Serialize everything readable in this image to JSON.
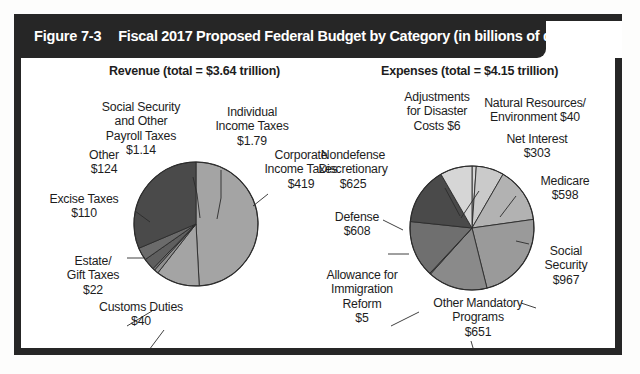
{
  "figure": {
    "number_label": "Figure 7-3",
    "title": "Fiscal 2017 Proposed Federal Budget by Category (in billions of dollars)"
  },
  "colors": {
    "banner_background": "#262626",
    "banner_text": "#ffffff",
    "frame_border": "#262626",
    "panel_background": "#ffffff",
    "slice_dark": "#4a4a4a",
    "slice_mid_dark": "#5f5f5f",
    "slice_mid": "#787878",
    "slice_gray": "#8f8f8f",
    "slice_light_gray": "#a4a4a4",
    "slice_lighter": "#bdbdbd",
    "slice_lightest": "#d6d6d6",
    "slice_outline": "#2b2b2b",
    "leader_line": "#2b2b2b",
    "label_text": "#1d1d1d"
  },
  "chart_data": [
    {
      "type": "pie",
      "title": "Revenue (total = $3.64 trillion)",
      "total_label": "$3.64 trillion",
      "units": "billions of dollars",
      "legend": "none",
      "grid": false,
      "categories": [
        "Individual Income Taxes",
        "Corporate Income Taxes",
        "Customs Duties",
        "Estate/Gift Taxes",
        "Excise Taxes",
        "Other",
        "Social Security and Other Payroll Taxes"
      ],
      "values": [
        1790,
        419,
        40,
        22,
        110,
        124,
        1140
      ],
      "value_labels": [
        "$1.79",
        "$419",
        "$40",
        "$22",
        "$110",
        "$124",
        "$1.14"
      ],
      "slices": [
        {
          "name": "Individual Income Taxes",
          "value": 1790,
          "value_label": "$1.79",
          "label_lines": [
            "Individual",
            "Income Taxes",
            "$1.79"
          ],
          "shade": "#a4a4a4",
          "start_deg": 0,
          "end_deg": 177
        },
        {
          "name": "Corporate Income Taxes",
          "value": 419,
          "value_label": "$419",
          "label_lines": [
            "Corporate",
            "Income Taxes",
            "$419"
          ],
          "shade": "#a4a4a4",
          "start_deg": 177,
          "end_deg": 218
        },
        {
          "name": "Customs Duties",
          "value": 40,
          "value_label": "$40",
          "label_lines": [
            "Customs Duties",
            "$40"
          ],
          "shade": "#8f8f8f",
          "start_deg": 218,
          "end_deg": 222
        },
        {
          "name": "Estate/Gift Taxes",
          "value": 22,
          "value_label": "$22",
          "label_lines": [
            "Estate/",
            "Gift Taxes",
            "$22"
          ],
          "shade": "#787878",
          "start_deg": 222,
          "end_deg": 224
        },
        {
          "name": "Excise Taxes",
          "value": 110,
          "value_label": "$110",
          "label_lines": [
            "Excise Taxes",
            "$110"
          ],
          "shade": "#5f5f5f",
          "start_deg": 224,
          "end_deg": 235
        },
        {
          "name": "Other",
          "value": 124,
          "value_label": "$124",
          "label_lines": [
            "Other",
            "$124"
          ],
          "shade": "#6b6b6b",
          "start_deg": 235,
          "end_deg": 247
        },
        {
          "name": "Social Security and Other Payroll Taxes",
          "value": 1140,
          "value_label": "$1.14",
          "label_lines": [
            "Social Security",
            "and Other",
            "Payroll Taxes",
            "$1.14"
          ],
          "shade": "#4a4a4a",
          "start_deg": 247,
          "end_deg": 360
        }
      ]
    },
    {
      "type": "pie",
      "title": "Expenses (total = $4.15 trillion)",
      "total_label": "$4.15 trillion",
      "units": "billions of dollars",
      "legend": "none",
      "grid": false,
      "categories": [
        "Natural Resources/Environment",
        "Net Interest",
        "Medicare",
        "Social Security",
        "Other Mandatory Programs",
        "Allowance for Immigration Reform",
        "Defense",
        "Nondefense Discretionary",
        "Adjustments for Disaster Costs"
      ],
      "values": [
        40,
        303,
        598,
        967,
        651,
        5,
        608,
        625,
        6
      ],
      "value_labels": [
        "$40",
        "$303",
        "$598",
        "$967",
        "$651",
        "$5",
        "$608",
        "$625",
        "$6"
      ],
      "slices": [
        {
          "name": "Natural Resources/Environment",
          "value": 40,
          "value_label": "$40",
          "label_lines": [
            "Natural Resources/",
            "Environment $40"
          ],
          "shade": "#d6d6d6",
          "start_deg": 0,
          "end_deg": 4
        },
        {
          "name": "Net Interest",
          "value": 303,
          "value_label": "$303",
          "label_lines": [
            "Net Interest",
            "$303"
          ],
          "shade": "#cacaca",
          "start_deg": 4,
          "end_deg": 30
        },
        {
          "name": "Medicare",
          "value": 598,
          "value_label": "$598",
          "label_lines": [
            "Medicare",
            "$598"
          ],
          "shade": "#b2b2b2",
          "start_deg": 30,
          "end_deg": 82
        },
        {
          "name": "Social Security",
          "value": 967,
          "value_label": "$967",
          "label_lines": [
            "Social",
            "Security",
            "$967"
          ],
          "shade": "#9a9a9a",
          "start_deg": 82,
          "end_deg": 166
        },
        {
          "name": "Other Mandatory Programs",
          "value": 651,
          "value_label": "$651",
          "label_lines": [
            "Other Mandatory",
            "Programs",
            "$651"
          ],
          "shade": "#8a8a8a",
          "start_deg": 166,
          "end_deg": 222
        },
        {
          "name": "Allowance for Immigration Reform",
          "value": 5,
          "value_label": "$5",
          "label_lines": [
            "Allowance for",
            "Immigration",
            "Reform",
            "$5"
          ],
          "shade": "#6f6f6f",
          "start_deg": 222,
          "end_deg": 223
        },
        {
          "name": "Defense",
          "value": 608,
          "value_label": "$608",
          "label_lines": [
            "Defense",
            "$608"
          ],
          "shade": "#6f6f6f",
          "start_deg": 223,
          "end_deg": 276
        },
        {
          "name": "Nondefense Discretionary",
          "value": 625,
          "value_label": "$625",
          "label_lines": [
            "Nondefense",
            "Discretionary",
            "$625"
          ],
          "shade": "#4a4a4a",
          "start_deg": 276,
          "end_deg": 330
        },
        {
          "name": "Adjustments for Disaster Costs",
          "value": 6,
          "value_label": "$6",
          "label_lines": [
            "Adjustments",
            "for Disaster",
            "Costs $6"
          ],
          "shade": "#d6d6d6",
          "start_deg": 330,
          "end_deg": 360
        }
      ]
    }
  ],
  "revenue_labels": {
    "individual": "Individual\nIncome Taxes\n$1.79",
    "corporate": "Corporate\nIncome Taxes\n$419",
    "customs": "Customs Duties\n$40",
    "estate": "Estate/\nGift Taxes\n$22",
    "excise": "Excise Taxes\n$110",
    "other": "Other\n$124",
    "payroll": "Social Security\nand Other\nPayroll Taxes\n$1.14"
  },
  "expense_labels": {
    "adjustments": "Adjustments\nfor Disaster\nCosts $6",
    "natural_resources": "Natural Resources/\nEnvironment $40",
    "net_interest": "Net Interest\n$303",
    "medicare": "Medicare\n$598",
    "social_security": "Social\nSecurity\n$967",
    "other_mandatory": "Other Mandatory\nPrograms\n$651",
    "immigration": "Allowance for\nImmigration\nReform\n$5",
    "defense": "Defense\n$608",
    "nondefense": "Nondefense\nDiscretionary\n$625"
  },
  "titles": {
    "revenue": "Revenue (total = $3.64 trillion)",
    "expenses": "Expenses (total = $4.15 trillion)"
  }
}
